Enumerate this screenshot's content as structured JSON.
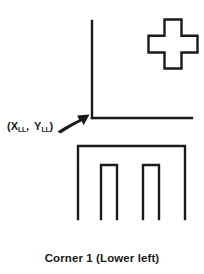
{
  "figure": {
    "caption": "Corner 1 (Lower left)",
    "background_color": "#ffffff",
    "ink_color": "#1a1a1a",
    "width": 204,
    "height": 274
  },
  "coordinate_label": {
    "open_paren": "(",
    "x_symbol": "X",
    "x_subscript": "LL",
    "separator": ", ",
    "y_symbol": "Y",
    "y_subscript": "LL",
    "close_paren": ")",
    "full_text": "(X_LL, Y_LL)",
    "meaning": "lower-left corner coordinate"
  },
  "elements": {
    "axes": {
      "name": "corner-axes",
      "description": "L-shaped corner formed by a vertical line and a horizontal line meeting at the lower-left origin",
      "vertical_line": {
        "x": 92,
        "y_top": 21,
        "y_bottom": 118
      },
      "horizontal_line": {
        "y": 118,
        "x_left": 92,
        "x_right": 192
      },
      "stroke_width": 2.4
    },
    "arrow": {
      "name": "pointer-arrow",
      "description": "curved arrow pointing up-right toward the corner origin",
      "tip": {
        "x": 89,
        "y": 115
      },
      "tail": {
        "x": 58,
        "y": 131
      }
    },
    "cross": {
      "name": "cross-outline",
      "description": "hollow plus / cross symbol outline at upper right",
      "center": {
        "x": 173,
        "y": 44
      },
      "arm_length": 25,
      "arm_width": 17,
      "stroke_width": 2.4
    },
    "castellated": {
      "name": "castellated-outline",
      "description": "m-shaped open polygon with two rectangular notches cut from the bottom",
      "left": 78,
      "right": 185,
      "top": 146,
      "bottom": 219,
      "notch_top": 165,
      "notches": [
        {
          "left": 101,
          "right": 117
        },
        {
          "left": 143,
          "right": 159
        }
      ],
      "stroke_width": 2.4
    }
  }
}
